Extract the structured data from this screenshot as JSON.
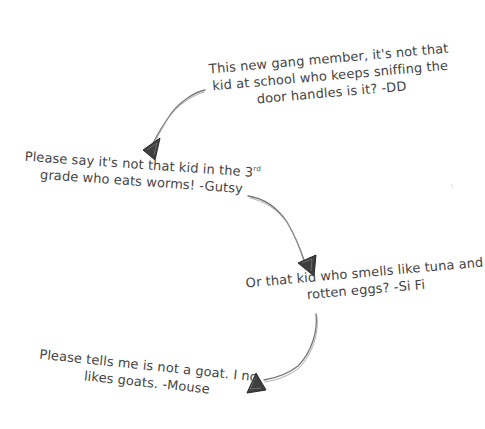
{
  "notes": [
    {
      "id": "dd",
      "lines": [
        "This new gang member, it's not that",
        "kid at school who keeps sniffing the",
        "door handles is it? -DD"
      ],
      "author": "DD"
    },
    {
      "id": "gutsy",
      "lines": [
        "Please say it's not that kid in the 3",
        "grade who eats worms! -Gutsy"
      ],
      "superscript": "rd",
      "author": "Gutsy"
    },
    {
      "id": "sifi",
      "lines": [
        "Or that kid who smells like tuna and",
        "rotten eggs? -Si Fi"
      ],
      "author": "Si Fi"
    },
    {
      "id": "mouse",
      "lines": [
        "Please tells me is not a goat. I no",
        "likes goats. -Mouse"
      ],
      "author": "Mouse"
    }
  ],
  "colors": {
    "ink": "#454545",
    "pencil": "#6a6a6a",
    "background": "#ffffff"
  }
}
